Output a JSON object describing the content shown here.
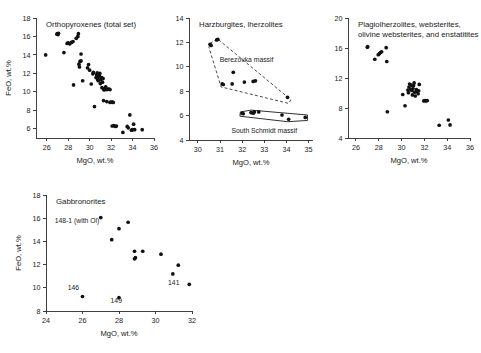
{
  "figure": {
    "background": "#ffffff",
    "point_color": "#111111",
    "axis_color": "#2b2b2b"
  },
  "chart_data": [
    {
      "id": "orthopyroxenes",
      "type": "scatter",
      "title": "Orthopyroxenes (total set)",
      "xlabel": "MgO, wt.%",
      "ylabel": "FeO, wt.%",
      "xlim": [
        25,
        36
      ],
      "ylim": [
        5,
        18
      ],
      "xticks": [
        26,
        28,
        30,
        32,
        34,
        36
      ],
      "yticks": [
        6,
        8,
        10,
        12,
        14,
        16,
        18
      ],
      "grid": false,
      "legend": "none",
      "points": [
        [
          25.9,
          14.0
        ],
        [
          26.95,
          16.25
        ],
        [
          27.0,
          16.3
        ],
        [
          27.05,
          16.2
        ],
        [
          27.1,
          16.35
        ],
        [
          27.6,
          14.25
        ],
        [
          27.9,
          15.25
        ],
        [
          28.0,
          15.3
        ],
        [
          28.15,
          15.2
        ],
        [
          28.3,
          15.35
        ],
        [
          28.45,
          15.45
        ],
        [
          28.5,
          10.75
        ],
        [
          28.75,
          15.8
        ],
        [
          28.9,
          16.0
        ],
        [
          28.95,
          16.3
        ],
        [
          29.0,
          13.0
        ],
        [
          29.05,
          12.7
        ],
        [
          29.1,
          13.3
        ],
        [
          29.2,
          13.35
        ],
        [
          29.2,
          14.1
        ],
        [
          29.35,
          11.2
        ],
        [
          29.8,
          12.6
        ],
        [
          29.9,
          12.95
        ],
        [
          30.0,
          12.35
        ],
        [
          30.15,
          10.85
        ],
        [
          30.3,
          11.95
        ],
        [
          30.35,
          12.1
        ],
        [
          30.45,
          8.4
        ],
        [
          30.6,
          11.55
        ],
        [
          30.65,
          11.85
        ],
        [
          30.7,
          12.05
        ],
        [
          30.75,
          11.35
        ],
        [
          30.8,
          11.2
        ],
        [
          30.85,
          11.6
        ],
        [
          30.9,
          11.75
        ],
        [
          30.95,
          12.0
        ],
        [
          31.0,
          10.9
        ],
        [
          31.05,
          11.3
        ],
        [
          31.1,
          11.55
        ],
        [
          31.15,
          10.45
        ],
        [
          31.2,
          11.05
        ],
        [
          31.25,
          11.45
        ],
        [
          31.3,
          10.3
        ],
        [
          31.35,
          10.2
        ],
        [
          31.45,
          10.35
        ],
        [
          31.5,
          10.55
        ],
        [
          31.6,
          10.25
        ],
        [
          31.7,
          10.3
        ],
        [
          31.8,
          10.3
        ],
        [
          31.9,
          10.25
        ],
        [
          31.3,
          9.05
        ],
        [
          31.6,
          8.95
        ],
        [
          31.9,
          8.85
        ],
        [
          32.0,
          8.9
        ],
        [
          32.1,
          8.9
        ],
        [
          32.2,
          8.85
        ],
        [
          32.1,
          6.3
        ],
        [
          32.25,
          6.35
        ],
        [
          32.4,
          6.25
        ],
        [
          32.5,
          6.3
        ],
        [
          33.1,
          5.6
        ],
        [
          33.5,
          6.25
        ],
        [
          33.6,
          6.1
        ],
        [
          33.75,
          7.5
        ],
        [
          33.9,
          5.85
        ],
        [
          34.0,
          5.9
        ],
        [
          34.1,
          6.5
        ],
        [
          34.2,
          5.9
        ],
        [
          34.9,
          5.9
        ]
      ]
    },
    {
      "id": "harzburgites-lherzolites",
      "type": "scatter",
      "title": "Harzburgites, lherzolites",
      "xlabel": "MgO, wt.%",
      "ylabel": "",
      "xlim": [
        29.6,
        35.2
      ],
      "ylim": [
        4,
        14
      ],
      "xticks": [
        30,
        31,
        32,
        33,
        34,
        35
      ],
      "yticks": [
        4,
        6,
        8,
        10,
        12,
        14
      ],
      "grid": false,
      "legend": "none",
      "annotations": [
        {
          "text": "Berezovka massif",
          "x": 32.2,
          "y": 10.4
        },
        {
          "text": "South Schmidt massif",
          "x": 33.0,
          "y": 4.6
        }
      ],
      "fields": [
        {
          "name": "Berezovka massif",
          "style": "dashed",
          "vertices": [
            [
              30.55,
              11.9
            ],
            [
              30.88,
              12.3
            ],
            [
              34.2,
              7.3
            ],
            [
              34.1,
              7.0
            ],
            [
              31.05,
              8.35
            ],
            [
              30.5,
              11.6
            ]
          ]
        },
        {
          "name": "South Schmidt massif",
          "style": "solid",
          "vertices": [
            [
              31.92,
              6.3
            ],
            [
              32.4,
              6.45
            ],
            [
              34.95,
              6.05
            ],
            [
              34.95,
              5.6
            ],
            [
              34.05,
              5.5
            ],
            [
              31.9,
              5.95
            ]
          ]
        }
      ],
      "points": [
        [
          30.6,
          11.75
        ],
        [
          30.55,
          11.85
        ],
        [
          30.85,
          12.2
        ],
        [
          30.9,
          12.25
        ],
        [
          31.1,
          8.6
        ],
        [
          31.15,
          8.55
        ],
        [
          31.55,
          8.6
        ],
        [
          31.6,
          9.55
        ],
        [
          32.1,
          8.75
        ],
        [
          32.5,
          8.8
        ],
        [
          32.6,
          8.85
        ],
        [
          34.05,
          7.5
        ],
        [
          32.0,
          6.2
        ],
        [
          32.05,
          6.15
        ],
        [
          32.4,
          6.25
        ],
        [
          32.5,
          6.2
        ],
        [
          32.55,
          6.3
        ],
        [
          32.75,
          6.3
        ],
        [
          33.8,
          6.05
        ],
        [
          34.1,
          5.7
        ],
        [
          34.85,
          5.85
        ]
      ]
    },
    {
      "id": "plagiolherzolites",
      "type": "scatter",
      "title": "Plagiolherzolites, websterites,",
      "title_line2": "olivine websterites, and enstatitites",
      "xlabel": "MgO, wt.%",
      "ylabel": "",
      "xlim": [
        25.3,
        36
      ],
      "ylim": [
        4,
        20
      ],
      "xticks": [
        26,
        28,
        30,
        32,
        34,
        36
      ],
      "yticks": [
        4,
        8,
        12,
        16,
        20
      ],
      "grid": false,
      "legend": "none",
      "points": [
        [
          27.0,
          16.1
        ],
        [
          27.02,
          16.2
        ],
        [
          27.65,
          14.5
        ],
        [
          27.95,
          15.1
        ],
        [
          28.05,
          15.25
        ],
        [
          28.15,
          15.4
        ],
        [
          28.25,
          15.5
        ],
        [
          28.65,
          16.05
        ],
        [
          28.7,
          14.2
        ],
        [
          28.75,
          7.5
        ],
        [
          30.1,
          9.8
        ],
        [
          30.3,
          8.3
        ],
        [
          30.55,
          10.4
        ],
        [
          30.6,
          10.05
        ],
        [
          30.65,
          10.8
        ],
        [
          30.7,
          11.2
        ],
        [
          30.8,
          10.5
        ],
        [
          30.85,
          11.05
        ],
        [
          30.9,
          10.35
        ],
        [
          30.95,
          9.75
        ],
        [
          31.0,
          10.6
        ],
        [
          31.05,
          11.0
        ],
        [
          31.1,
          11.35
        ],
        [
          31.15,
          10.1
        ],
        [
          31.2,
          9.6
        ],
        [
          31.3,
          10.45
        ],
        [
          31.35,
          10.2
        ],
        [
          31.45,
          9.9
        ],
        [
          31.5,
          10.3
        ],
        [
          31.55,
          11.15
        ],
        [
          31.95,
          8.95
        ],
        [
          32.05,
          9.0
        ],
        [
          32.15,
          8.95
        ],
        [
          32.25,
          9.0
        ],
        [
          33.3,
          5.7
        ],
        [
          34.1,
          6.4
        ],
        [
          34.25,
          5.75
        ]
      ]
    },
    {
      "id": "gabbronorites",
      "type": "scatter",
      "title": "Gabbronorites",
      "xlabel": "MgO, wt.%",
      "ylabel": "FeO, wt.%",
      "xlim": [
        24,
        32
      ],
      "ylim": [
        8,
        18
      ],
      "xticks": [
        24,
        26,
        28,
        30,
        32
      ],
      "yticks": [
        8,
        10,
        12,
        14,
        16,
        18
      ],
      "grid": false,
      "legend": "none",
      "annotations": [
        {
          "text": "148-1 (with Ol)",
          "x": 25.7,
          "y": 15.55
        },
        {
          "text": "146",
          "x": 25.5,
          "y": 9.85
        },
        {
          "text": "149",
          "x": 27.85,
          "y": 8.65
        },
        {
          "text": "141",
          "x": 31.0,
          "y": 10.25
        }
      ],
      "points": [
        [
          27.0,
          16.05
        ],
        [
          28.5,
          15.65
        ],
        [
          28.0,
          15.1
        ],
        [
          27.6,
          14.15
        ],
        [
          28.85,
          13.15
        ],
        [
          29.3,
          13.15
        ],
        [
          28.85,
          12.5
        ],
        [
          28.9,
          12.6
        ],
        [
          30.3,
          12.9
        ],
        [
          31.25,
          11.95
        ],
        [
          30.95,
          11.2
        ],
        [
          31.85,
          10.3
        ],
        [
          26.0,
          9.25
        ],
        [
          28.0,
          9.15
        ]
      ]
    }
  ]
}
